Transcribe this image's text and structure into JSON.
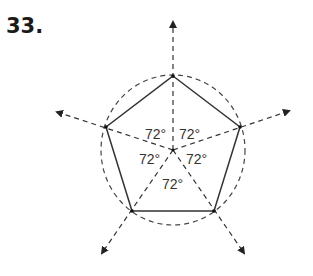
{
  "problem": {
    "number": "33."
  },
  "diagram": {
    "shape": "regular pentagon inscribed in circle",
    "angles": [
      {
        "label": "72°",
        "x": 155,
        "y": 137
      },
      {
        "label": "72°",
        "x": 190,
        "y": 137
      },
      {
        "label": "72°",
        "x": 151,
        "y": 162
      },
      {
        "label": "72°",
        "x": 196,
        "y": 162
      },
      {
        "label": "72°",
        "x": 174,
        "y": 186
      }
    ]
  }
}
